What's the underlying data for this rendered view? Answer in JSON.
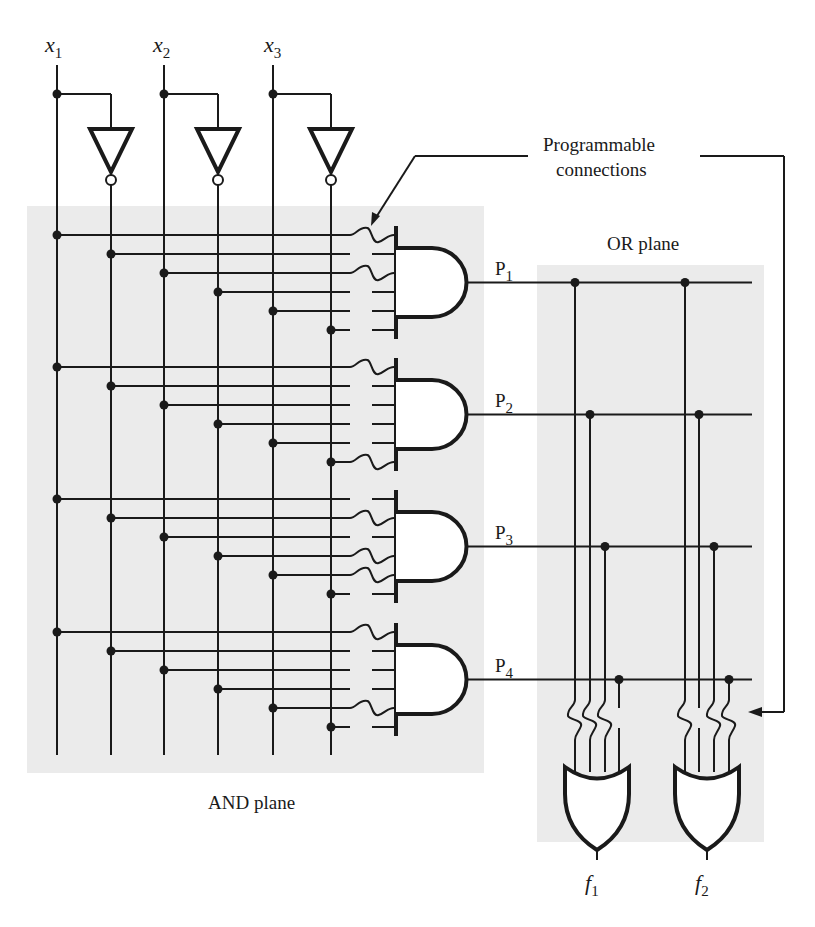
{
  "diagram": {
    "colors": {
      "wire": "#1a1a1a",
      "plane_fill": "#ebebeb",
      "background": "#ffffff"
    },
    "inputs": [
      {
        "name": "x",
        "sub": "1",
        "x": 57,
        "comp_x": 111
      },
      {
        "name": "x",
        "sub": "2",
        "x": 164,
        "comp_x": 218
      },
      {
        "name": "x",
        "sub": "3",
        "x": 273,
        "comp_x": 331
      }
    ],
    "and_plane": {
      "label": "AND plane",
      "line_order": [
        "x1",
        "x1'",
        "x2",
        "x2'",
        "x3",
        "x3'"
      ],
      "products": [
        {
          "name": "P",
          "sub": "1",
          "top_y": 235,
          "fuses_intact": [
            0,
            2
          ],
          "expression": "x1·x2"
        },
        {
          "name": "P",
          "sub": "2",
          "top_y": 367,
          "fuses_intact": [
            0,
            5
          ],
          "expression": "x1·x3'"
        },
        {
          "name": "P",
          "sub": "3",
          "top_y": 499,
          "fuses_intact": [
            1,
            3,
            4
          ],
          "expression": "x1'·x2'·x3"
        },
        {
          "name": "P",
          "sub": "4",
          "top_y": 632,
          "fuses_intact": [
            0,
            4
          ],
          "expression": "x1·x3"
        }
      ]
    },
    "or_plane": {
      "label": "OR plane",
      "outputs": [
        {
          "name": "f",
          "sub": "1",
          "columns": [
            575,
            590,
            605,
            619
          ],
          "fuses_intact": [
            0,
            1,
            2
          ],
          "expression": "P1 + P2 + P3"
        },
        {
          "name": "f",
          "sub": "2",
          "columns": [
            685,
            699,
            714,
            729
          ],
          "fuses_intact": [
            0,
            2,
            3
          ],
          "expression": "P1 + P3 + P4"
        }
      ]
    },
    "annotation": {
      "line1": "Programmable",
      "line2": "connections"
    }
  }
}
